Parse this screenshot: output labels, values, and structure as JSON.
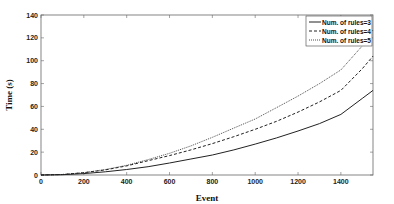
{
  "chart_data": {
    "type": "line",
    "title": "",
    "xlabel": "Event",
    "ylabel": "Time (s)",
    "xlim": [
      0,
      1550
    ],
    "ylim": [
      0,
      140
    ],
    "xticks": [
      0,
      200,
      400,
      600,
      800,
      1000,
      1200,
      1400
    ],
    "yticks": [
      0,
      20,
      40,
      60,
      80,
      100,
      120,
      140
    ],
    "grid": false,
    "legend_position": "upper right",
    "x": [
      0,
      100,
      200,
      300,
      400,
      500,
      600,
      700,
      800,
      900,
      1000,
      1100,
      1200,
      1300,
      1400,
      1500,
      1550
    ],
    "series": [
      {
        "name": "Num. of rules=3",
        "style": "solid",
        "values": [
          0,
          0.3,
          1.2,
          2.8,
          4.8,
          7.3,
          10.5,
          14,
          17.5,
          22,
          27,
          32.5,
          38.5,
          45,
          53,
          67,
          74
        ]
      },
      {
        "name": "Num. of rules=4",
        "style": "dashed",
        "values": [
          0,
          0.4,
          2,
          4.5,
          8,
          12.5,
          17,
          22,
          27.5,
          33.5,
          40,
          47,
          55,
          64,
          74,
          93,
          104
        ]
      },
      {
        "name": "Num. of rules=5",
        "style": "dotted",
        "values": [
          0,
          0.4,
          2,
          4.8,
          8.5,
          13.5,
          19,
          25.5,
          33,
          41,
          49,
          59,
          69,
          80,
          92,
          113,
          127
        ]
      }
    ]
  },
  "colors": {
    "axis": "#555555",
    "line": "#222222",
    "background": "#ffffff"
  }
}
